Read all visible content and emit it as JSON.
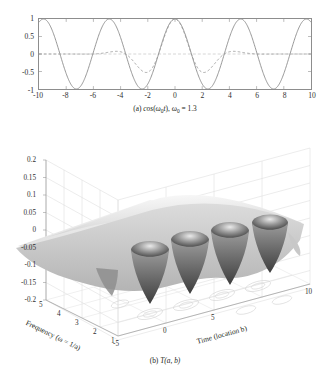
{
  "figure": {
    "background": "#ffffff",
    "ink": "#231f20",
    "axis_color": "#8d8d8d"
  },
  "panel_a": {
    "caption_prefix": "(a)",
    "caption_func": "cos",
    "caption_arg_open": "(",
    "caption_omega": "ω",
    "caption_sub0": "0",
    "caption_t": "t",
    "caption_arg_close": ")",
    "caption_comma": ", ",
    "caption_omega2": "ω",
    "caption_sub0b": "0",
    "caption_eq": " = 1.3",
    "caption_full": "(a) cos (ω₀t), ω₀ = 1.3",
    "line_solid_color": "#8a8a8a",
    "line_dashed_color": "#9a9a9a",
    "y_ticks": [
      "1",
      "0.5",
      "0",
      "-0.5",
      "-1"
    ],
    "x_ticks": [
      "-10",
      "-8",
      "-6",
      "-4",
      "-2",
      "0",
      "2",
      "4",
      "6",
      "8",
      "10"
    ]
  },
  "panel_b": {
    "caption_prefix": "(b)",
    "caption_T": "T",
    "caption_args": "(a, b)",
    "caption_full": "(b) T(a, b)",
    "z_ticks": [
      "0.2",
      "0.15",
      "0.1",
      "0.05",
      "0",
      "-0.05",
      "-0.1",
      "-0.15",
      "-0.2"
    ],
    "freq_ticks": [
      "5",
      "4",
      "3",
      "2",
      "1"
    ],
    "time_ticks": [
      "-5",
      "0",
      "5",
      "10"
    ],
    "freq_title": "Frequency (ω = 1/a)",
    "time_title": "Time (location b)",
    "surface_light": "#f2f2f2",
    "surface_mid": "#bdbdbd",
    "surface_dark": "#4a4a4a",
    "grid_color": "#d8d8d8"
  },
  "chart_data": [
    {
      "type": "line",
      "title": "(a) cos (ω₀t), ω₀ = 1.3",
      "xlabel": "",
      "ylabel": "",
      "xlim": [
        -10,
        10
      ],
      "ylim": [
        -1,
        1
      ],
      "xticks": [
        -10,
        -8,
        -6,
        -4,
        -2,
        0,
        2,
        4,
        6,
        8,
        10
      ],
      "yticks": [
        -1,
        -0.5,
        0,
        0.5,
        1
      ],
      "grid": false,
      "legend": "none",
      "series": [
        {
          "name": "cos(omega0 t), omega0 = 1.3",
          "style": "solid",
          "color": "#8a8a8a",
          "description": "cosine of angular frequency 1.3 rad/s, period 4.833, amplitude 1, spanning x from -10 to 10",
          "formula": "cos(1.3*x)",
          "sample_x": [
            -10,
            -9,
            -8,
            -7,
            -6,
            -5,
            -4,
            -3,
            -2,
            -1,
            0,
            1,
            2,
            3,
            4,
            5,
            6,
            7,
            8,
            9,
            10
          ],
          "sample_y": [
            0.91,
            0.27,
            -0.52,
            -0.99,
            -0.68,
            0.1,
            0.79,
            0.94,
            0.27,
            0.27,
            1.0,
            0.27,
            -0.86,
            -0.94,
            0.79,
            0.1,
            -0.68,
            -0.99,
            -0.52,
            0.27,
            0.91
          ]
        },
        {
          "name": "Morlet wavelet envelope (dashed)",
          "style": "dashed",
          "color": "#9a9a9a",
          "description": "decaying oscillatory wavelet centred at x=0, peak value 1, decaying to near 0 beyond |x| > 5",
          "formula": "exp(-x^2/8)*cos(1.3*x)",
          "sample_x": [
            -10,
            -8,
            -6,
            -5,
            -4,
            -3,
            -2,
            -1,
            0,
            1,
            2,
            3,
            4,
            5,
            6,
            8,
            10
          ],
          "sample_y": [
            0.0,
            -0.02,
            -0.07,
            0.01,
            0.19,
            0.31,
            0.02,
            0.24,
            1.0,
            0.24,
            -0.35,
            -0.31,
            0.19,
            0.04,
            -0.07,
            -0.02,
            0.0
          ]
        }
      ]
    },
    {
      "type": "surface",
      "title": "(b) T(a, b)",
      "xlabel": "Time (location b)",
      "ylabel": "Frequency (ω = 1/a)",
      "zlabel": "",
      "xlim": [
        -5,
        10
      ],
      "ylim": [
        1,
        5
      ],
      "zlim": [
        -0.2,
        0.2
      ],
      "xticks": [
        -5,
        0,
        5,
        10
      ],
      "yticks": [
        1,
        2,
        3,
        4,
        5
      ],
      "zticks": [
        -0.2,
        -0.15,
        -0.1,
        -0.05,
        0,
        0.05,
        0.1,
        0.15,
        0.2
      ],
      "grid": true,
      "colormap": "grayscale",
      "description": "Continuous wavelet transform magnitude surface. A nearly flat plateau near z = 0 at high frequency (a small) rises toward a broad ridge, and four deep periodic troughs reaching about -0.2 appear along the time axis at low frequency, spaced by the 4.83 period of the 1.3 rad/s carrier.",
      "ridge_peak_z": 0.05,
      "trough_min_z": -0.2,
      "trough_count": 4,
      "trough_time_positions": [
        -2.4,
        0.0,
        2.4,
        4.8
      ]
    }
  ]
}
